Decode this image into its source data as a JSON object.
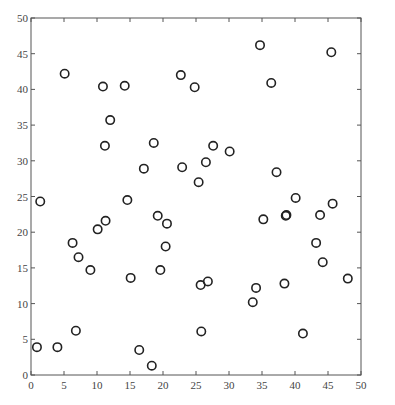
{
  "chart_data": {
    "type": "scatter",
    "title": "",
    "xlabel": "",
    "ylabel": "",
    "xlim": [
      0,
      50
    ],
    "ylim": [
      0,
      50
    ],
    "xticks": [
      0,
      5,
      10,
      15,
      20,
      25,
      30,
      35,
      40,
      45,
      50
    ],
    "yticks": [
      0,
      5,
      10,
      15,
      20,
      25,
      30,
      35,
      40,
      45,
      50
    ],
    "grid": false,
    "legend": null,
    "marker": "open-circle",
    "marker_color": "#222222",
    "series": [
      {
        "name": "points",
        "x": [
          0.9,
          1.4,
          4.0,
          5.1,
          6.3,
          6.8,
          7.2,
          9.0,
          10.1,
          10.9,
          11.2,
          11.3,
          12.0,
          14.2,
          14.6,
          15.1,
          16.4,
          17.1,
          18.3,
          18.6,
          19.2,
          19.6,
          20.4,
          20.6,
          22.7,
          22.9,
          24.8,
          25.4,
          25.7,
          25.8,
          26.5,
          26.8,
          27.6,
          30.1,
          33.6,
          34.1,
          34.7,
          35.2,
          36.4,
          37.2,
          38.4,
          38.6,
          38.7,
          40.1,
          41.2,
          43.2,
          43.8,
          44.2,
          45.5,
          45.7,
          48.0
        ],
        "y": [
          3.9,
          24.3,
          3.9,
          42.2,
          18.5,
          6.2,
          16.5,
          14.7,
          20.4,
          40.4,
          32.1,
          21.6,
          35.7,
          40.5,
          24.5,
          13.6,
          3.5,
          28.9,
          1.3,
          32.5,
          22.3,
          14.7,
          18.0,
          21.2,
          42.0,
          29.1,
          40.3,
          27.0,
          12.6,
          6.1,
          29.8,
          13.1,
          32.1,
          31.3,
          10.2,
          12.2,
          46.2,
          21.8,
          40.9,
          28.4,
          12.8,
          22.3,
          22.4,
          24.8,
          5.8,
          18.5,
          22.4,
          15.8,
          45.2,
          24.0,
          13.5
        ]
      }
    ]
  },
  "footer": {
    "stray_text": "···"
  }
}
